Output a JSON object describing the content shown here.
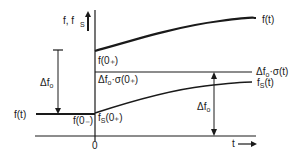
{
  "diagram": {
    "axis_y_label_main": "f, f",
    "axis_y_label_sub": "S",
    "axis_x_label": "t",
    "origin_label": "0",
    "curves": {
      "f_upper_label": "f(t)",
      "f_before_label": "f(t)",
      "step_label": "Δf",
      "step_label_tail": "·σ(t)",
      "fs_label": "f",
      "fs_label_sub": "S",
      "fs_label_tail": "(t)"
    },
    "annotations": {
      "f0_plus": "f(0₊)",
      "f0_minus": "f(0₋)",
      "step_at_0_main": "Δf",
      "step_at_0_tail": "·σ(0₊)",
      "fs0_main": "f",
      "fs0_sub": "S",
      "fs0_tail": "(0₊)",
      "delta_left_main": "Δf",
      "delta_right_main": "Δf",
      "sub_o": "o"
    },
    "colors": {
      "ink": "#1a1a1a",
      "background": "#ffffff"
    }
  }
}
